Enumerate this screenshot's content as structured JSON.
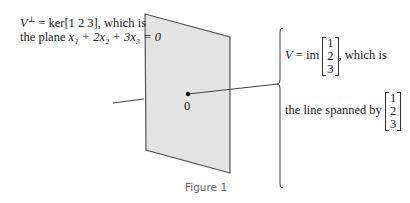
{
  "left_label": {
    "line1_prefix": "V",
    "line1_sup": "⊥",
    "line1_rest": " = ker[1  2  3], which is",
    "line2_prefix": "the plane ",
    "line2_eq": "x₁ + 2x₂ + 3x₃ = 0"
  },
  "origin_label": "0",
  "right_label": {
    "line1_prefix": "V",
    "line1_mid": " = im",
    "line1_suffix": ", which is",
    "line2": "the line spanned by",
    "vector": [
      "1",
      "2",
      "3"
    ]
  },
  "caption": "Figure 1",
  "colors": {
    "plane_fill": "#e3e3e3",
    "plane_stroke": "#555555",
    "line": "#444444"
  }
}
